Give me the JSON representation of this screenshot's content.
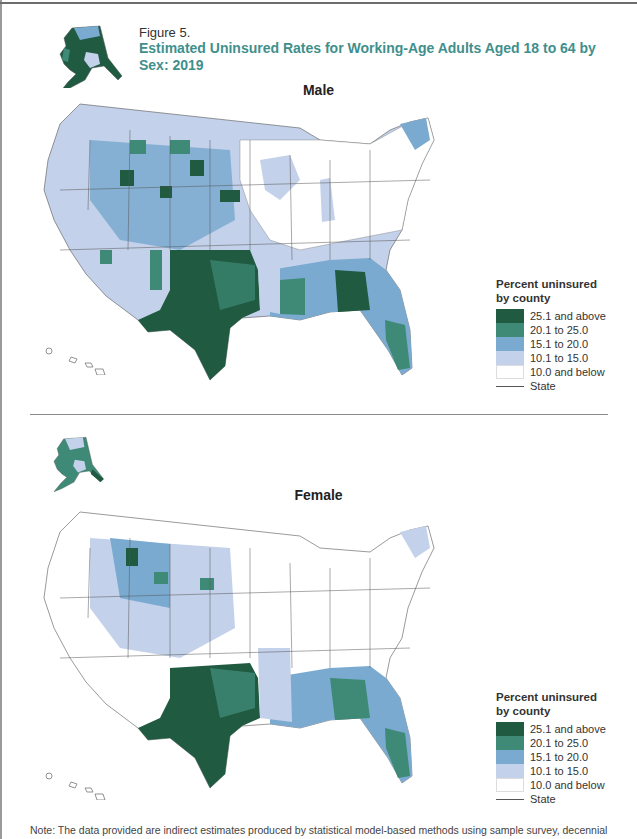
{
  "figure": {
    "label": "Figure 5.",
    "title": "Estimated Uninsured Rates for Working-Age Adults Aged 18 to 64 by Sex: 2019",
    "accent_color": "#3f8f8c"
  },
  "panels": [
    {
      "title": "Male",
      "legend": {
        "title_line1": "Percent uninsured",
        "title_line2": "by county",
        "items": [
          {
            "label": "25.1 and above",
            "color": "#1f5a41"
          },
          {
            "label": "20.1 to 25.0",
            "color": "#3e8a76"
          },
          {
            "label": "15.1 to 20.0",
            "color": "#7aaad0"
          },
          {
            "label": "10.1 to 15.0",
            "color": "#c3d1ea"
          },
          {
            "label": "10.0 and below",
            "color": "#ffffff"
          }
        ],
        "state_line_label": "State"
      }
    },
    {
      "title": "Female",
      "legend": {
        "title_line1": "Percent uninsured",
        "title_line2": "by county",
        "items": [
          {
            "label": "25.1 and above",
            "color": "#1f5a41"
          },
          {
            "label": "20.1 to 25.0",
            "color": "#3e8a76"
          },
          {
            "label": "15.1 to 20.0",
            "color": "#7aaad0"
          },
          {
            "label": "10.1 to 15.0",
            "color": "#c3d1ea"
          },
          {
            "label": "10.0 and below",
            "color": "#ffffff"
          }
        ],
        "state_line_label": "State"
      }
    }
  ],
  "note": "Note: The data provided are indirect estimates produced by statistical model-based methods using sample survey, decennial"
}
